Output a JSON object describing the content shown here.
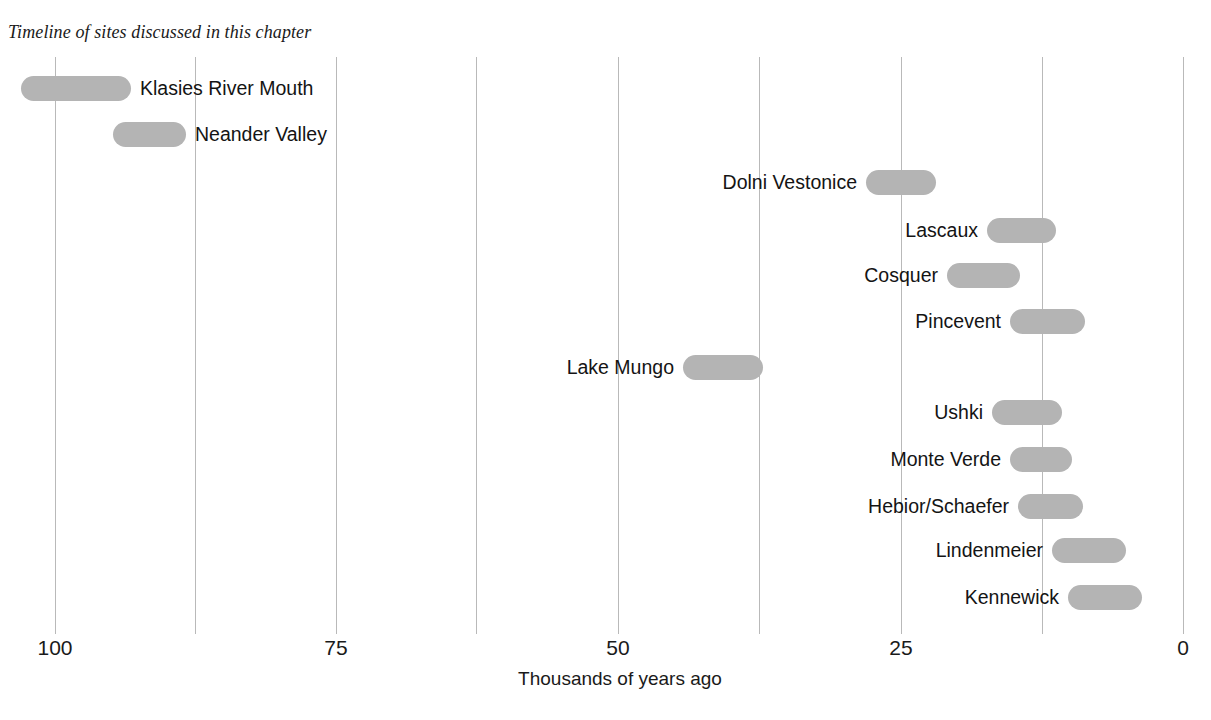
{
  "chart_data": {
    "type": "bar",
    "orientation": "horizontal-range",
    "title": "Timeline of sites discussed in this chapter",
    "xlabel": "Thousands of years ago",
    "ylabel": "",
    "xlim": [
      100,
      0
    ],
    "x_axis_reversed": true,
    "grid": "vertical",
    "legend": "none",
    "tick_labels": [
      "100",
      "75",
      "50",
      "25",
      "0"
    ],
    "tick_values": [
      100,
      75,
      50,
      25,
      0
    ],
    "gridline_values": [
      100,
      87.5,
      75,
      62.5,
      50,
      37.5,
      25,
      12.5,
      0
    ],
    "bar_color": "#b4b4b4",
    "axis_color": "#b9b9b9",
    "text_color": "#141414",
    "units": "thousands of years ago (ka)",
    "categories": [
      "Klasies River Mouth",
      "Neander Valley",
      "Dolni Vestonice",
      "Lascaux",
      "Cosquer",
      "Pincevent",
      "Lake Mungo",
      "Ushki",
      "Monte Verde",
      "Hebior/Schaefer",
      "Lindenmeier",
      "Kennewick"
    ],
    "ranges": [
      {
        "label": "Klasies River Mouth",
        "start": 118,
        "end": 93
      },
      {
        "label": "Neander Valley",
        "start": 95,
        "end": 88
      },
      {
        "label": "Dolni Vestonice",
        "start": 28,
        "end": 22
      },
      {
        "label": "Lascaux",
        "start": 17.4,
        "end": 11.3
      },
      {
        "label": "Cosquer",
        "start": 21,
        "end": 14.5
      },
      {
        "label": "Pincevent",
        "start": 15.3,
        "end": 8.7
      },
      {
        "label": "Lake Mungo",
        "start": 44.3,
        "end": 37.2
      },
      {
        "label": "Ushki",
        "start": 17,
        "end": 10.7
      },
      {
        "label": "Monte Verde",
        "start": 15.3,
        "end": 9.8
      },
      {
        "label": "Hebior/Schaefer",
        "start": 14.6,
        "end": 8.9
      },
      {
        "label": "Lindenmeier",
        "start": 11.6,
        "end": 5.1
      },
      {
        "label": "Kennewick",
        "start": 10.2,
        "end": 3.6
      }
    ]
  },
  "layout": {
    "bars": [
      {
        "label": "Klasies River Mouth",
        "x": 21,
        "w": 110,
        "y": 76
      },
      {
        "label": "Neander Valley",
        "x": 113,
        "w": 73,
        "y": 122
      },
      {
        "label": "Dolni Vestonice",
        "x": 866,
        "w": 70,
        "y": 170
      },
      {
        "label": "Lascaux",
        "x": 987,
        "w": 69,
        "y": 218
      },
      {
        "label": "Cosquer",
        "x": 947,
        "w": 73,
        "y": 263
      },
      {
        "label": "Pincevent",
        "x": 1010,
        "w": 75,
        "y": 309
      },
      {
        "label": "Lake Mungo",
        "x": 683,
        "w": 80,
        "y": 355
      },
      {
        "label": "Ushki",
        "x": 992,
        "w": 70,
        "y": 400
      },
      {
        "label": "Monte Verde",
        "x": 1010,
        "w": 62,
        "y": 447
      },
      {
        "label": "Hebior/Schaefer",
        "x": 1018,
        "w": 65,
        "y": 494
      },
      {
        "label": "Lindenmeier",
        "x": 1052,
        "w": 74,
        "y": 538
      },
      {
        "label": "Kennewick",
        "x": 1068,
        "w": 74,
        "y": 585
      }
    ],
    "gridlines_px": [
      55,
      195,
      336,
      476,
      618,
      759,
      901,
      1042,
      1183
    ],
    "ticks_px": [
      {
        "label": "100",
        "x": 55
      },
      {
        "label": "75",
        "x": 336
      },
      {
        "label": "50",
        "x": 618
      },
      {
        "label": "25",
        "x": 901
      },
      {
        "label": "0",
        "x": 1183
      }
    ]
  }
}
